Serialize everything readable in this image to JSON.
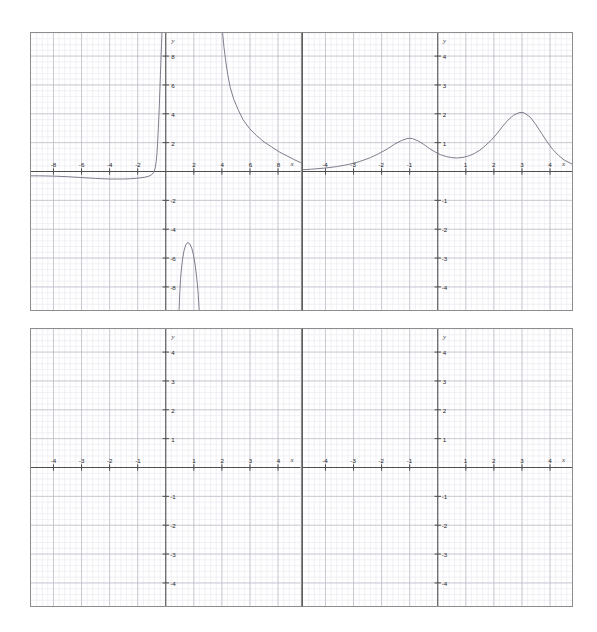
{
  "figure": {
    "width": 597,
    "height": 632,
    "background": "#ffffff",
    "panel_border_color": "#8d8d8d",
    "grid_minor_color": "#e3e3ec",
    "grid_major_color": "#b9b9c6",
    "axis_color": "#4d4d4d",
    "curve_color": "#6f6f80",
    "rows": 2,
    "cols": 2
  },
  "axis_names": {
    "x": "x",
    "y": "y"
  },
  "panels": [
    {
      "id": "panel-top-left",
      "xlabels": [
        "-8",
        "-6",
        "-4",
        "-2",
        "2",
        "4",
        "6",
        "8"
      ],
      "ylabels": [
        "8",
        "6",
        "4",
        "2",
        "-2",
        "-4",
        "-6",
        "-8"
      ],
      "xlim": [
        -9.6,
        9.6
      ],
      "ylim": [
        -9.6,
        9.6
      ],
      "has_curve": true
    },
    {
      "id": "panel-top-right",
      "xlabels": [
        "-4",
        "-3",
        "-2",
        "-1",
        "1",
        "2",
        "3",
        "4"
      ],
      "ylabels": [
        "4",
        "3",
        "2",
        "1",
        "-1",
        "-2",
        "-3",
        "-4"
      ],
      "xlim": [
        -4.8,
        4.8
      ],
      "ylim": [
        -4.8,
        4.8
      ],
      "has_curve": true
    },
    {
      "id": "panel-bottom-left",
      "xlabels": [
        "-4",
        "-3",
        "-2",
        "-1",
        "1",
        "2",
        "3",
        "4"
      ],
      "ylabels": [
        "4",
        "3",
        "2",
        "1",
        "-1",
        "-2",
        "-3",
        "-4"
      ],
      "xlim": [
        -4.8,
        4.8
      ],
      "ylim": [
        -4.8,
        4.8
      ],
      "has_curve": false
    },
    {
      "id": "panel-bottom-right",
      "xlabels": [
        "-4",
        "-3",
        "-2",
        "-1",
        "1",
        "2",
        "3",
        "4"
      ],
      "ylabels": [
        "4",
        "3",
        "2",
        "1",
        "-1",
        "-2",
        "-3",
        "-4"
      ],
      "xlim": [
        -4.8,
        4.8
      ],
      "ylim": [
        -4.8,
        4.8
      ],
      "has_curve": false
    }
  ],
  "chart_data": [
    {
      "type": "line",
      "title": "",
      "xlabel": "x",
      "ylabel": "y",
      "xlim": [
        -9.6,
        9.6
      ],
      "ylim": [
        -9.6,
        9.6
      ],
      "xticks": [
        -8,
        -6,
        -4,
        -2,
        2,
        4,
        6,
        8
      ],
      "yticks": [
        8,
        6,
        4,
        2,
        -2,
        -4,
        -6,
        -8
      ],
      "grid": true,
      "legend": "none",
      "panel": "top-left",
      "description": "Three disjoint branches: a flat slightly-negative left tail rising vertically near x=0, a descending right branch from x~4.5 decaying toward y~0.3, and an inverted narrow hump peaking near (1.5, -4.9).",
      "series": [
        {
          "name": "left-branch",
          "points": [
            [
              -9.6,
              -0.3
            ],
            [
              -9.0,
              -0.3
            ],
            [
              -8.0,
              -0.32
            ],
            [
              -7.0,
              -0.36
            ],
            [
              -6.0,
              -0.42
            ],
            [
              -5.0,
              -0.48
            ],
            [
              -4.0,
              -0.52
            ],
            [
              -3.0,
              -0.52
            ],
            [
              -2.5,
              -0.5
            ],
            [
              -2.0,
              -0.46
            ],
            [
              -1.5,
              -0.4
            ],
            [
              -1.2,
              -0.32
            ],
            [
              -1.0,
              -0.22
            ],
            [
              -0.85,
              -0.05
            ],
            [
              -0.75,
              0.25
            ],
            [
              -0.68,
              0.7
            ],
            [
              -0.62,
              1.3
            ],
            [
              -0.58,
              2.0
            ],
            [
              -0.54,
              2.8
            ],
            [
              -0.5,
              3.6
            ],
            [
              -0.46,
              4.5
            ],
            [
              -0.42,
              5.6
            ],
            [
              -0.38,
              6.7
            ],
            [
              -0.34,
              7.8
            ],
            [
              -0.3,
              8.8
            ],
            [
              -0.27,
              9.6
            ]
          ]
        },
        {
          "name": "right-branch",
          "points": [
            [
              4.05,
              9.6
            ],
            [
              4.15,
              8.6
            ],
            [
              4.28,
              7.6
            ],
            [
              4.42,
              6.7
            ],
            [
              4.6,
              5.8
            ],
            [
              4.85,
              5.0
            ],
            [
              5.15,
              4.3
            ],
            [
              5.5,
              3.6
            ],
            [
              5.95,
              3.0
            ],
            [
              6.45,
              2.5
            ],
            [
              7.0,
              2.05
            ],
            [
              7.55,
              1.7
            ],
            [
              8.1,
              1.35
            ],
            [
              8.7,
              1.05
            ],
            [
              9.2,
              0.8
            ],
            [
              9.6,
              0.62
            ]
          ]
        },
        {
          "name": "inverted-hump",
          "points": [
            [
              0.95,
              -9.6
            ],
            [
              1.0,
              -8.4
            ],
            [
              1.05,
              -7.5
            ],
            [
              1.12,
              -6.7
            ],
            [
              1.2,
              -6.05
            ],
            [
              1.3,
              -5.5
            ],
            [
              1.42,
              -5.1
            ],
            [
              1.55,
              -4.92
            ],
            [
              1.7,
              -5.0
            ],
            [
              1.85,
              -5.3
            ],
            [
              1.98,
              -5.8
            ],
            [
              2.1,
              -6.5
            ],
            [
              2.2,
              -7.3
            ],
            [
              2.3,
              -8.3
            ],
            [
              2.38,
              -9.6
            ]
          ]
        }
      ]
    },
    {
      "type": "line",
      "title": "",
      "xlabel": "x",
      "ylabel": "y",
      "xlim": [
        -4.8,
        4.8
      ],
      "ylim": [
        -4.8,
        4.8
      ],
      "xticks": [
        -4,
        -3,
        -2,
        -1,
        1,
        2,
        3,
        4
      ],
      "yticks": [
        4,
        3,
        2,
        1,
        -1,
        -2,
        -3,
        -4
      ],
      "grid": true,
      "legend": "none",
      "panel": "top-right",
      "description": "A positive, everywhere non-negative bimodal curve: a smaller peak of height about 1.15 at x=-1 and a taller peak of height about 2.05 at x=3, with a local dip near x=0.6 and tails decaying to zero.",
      "series": [
        {
          "name": "bimodal-curve",
          "points": [
            [
              -4.8,
              0.06
            ],
            [
              -4.5,
              0.08
            ],
            [
              -4.0,
              0.12
            ],
            [
              -3.6,
              0.17
            ],
            [
              -3.2,
              0.24
            ],
            [
              -2.8,
              0.34
            ],
            [
              -2.4,
              0.48
            ],
            [
              -2.1,
              0.62
            ],
            [
              -1.8,
              0.78
            ],
            [
              -1.55,
              0.94
            ],
            [
              -1.3,
              1.07
            ],
            [
              -1.1,
              1.14
            ],
            [
              -1.0,
              1.15
            ],
            [
              -0.9,
              1.14
            ],
            [
              -0.7,
              1.06
            ],
            [
              -0.5,
              0.94
            ],
            [
              -0.3,
              0.8
            ],
            [
              -0.1,
              0.68
            ],
            [
              0.1,
              0.58
            ],
            [
              0.3,
              0.52
            ],
            [
              0.5,
              0.48
            ],
            [
              0.7,
              0.47
            ],
            [
              0.9,
              0.49
            ],
            [
              1.1,
              0.54
            ],
            [
              1.3,
              0.62
            ],
            [
              1.5,
              0.74
            ],
            [
              1.7,
              0.9
            ],
            [
              1.9,
              1.08
            ],
            [
              2.1,
              1.3
            ],
            [
              2.3,
              1.55
            ],
            [
              2.5,
              1.78
            ],
            [
              2.7,
              1.95
            ],
            [
              2.9,
              2.04
            ],
            [
              3.0,
              2.05
            ],
            [
              3.1,
              2.02
            ],
            [
              3.3,
              1.88
            ],
            [
              3.5,
              1.62
            ],
            [
              3.7,
              1.32
            ],
            [
              3.9,
              1.02
            ],
            [
              4.1,
              0.76
            ],
            [
              4.3,
              0.56
            ],
            [
              4.5,
              0.4
            ],
            [
              4.8,
              0.25
            ]
          ]
        }
      ]
    },
    {
      "type": "line",
      "title": "",
      "xlabel": "x",
      "ylabel": "y",
      "xlim": [
        -4.8,
        4.8
      ],
      "ylim": [
        -4.8,
        4.8
      ],
      "xticks": [
        -4,
        -3,
        -2,
        -1,
        1,
        2,
        3,
        4
      ],
      "yticks": [
        4,
        3,
        2,
        1,
        -1,
        -2,
        -3,
        -4
      ],
      "grid": true,
      "legend": "none",
      "panel": "bottom-left",
      "description": "Empty coordinate grid with no plotted data.",
      "series": []
    },
    {
      "type": "line",
      "title": "",
      "xlabel": "x",
      "ylabel": "y",
      "xlim": [
        -4.8,
        4.8
      ],
      "ylim": [
        -4.8,
        4.8
      ],
      "xticks": [
        -4,
        -3,
        -2,
        -1,
        1,
        2,
        3,
        4
      ],
      "yticks": [
        4,
        3,
        2,
        1,
        -1,
        -2,
        -3,
        -4
      ],
      "grid": true,
      "legend": "none",
      "panel": "bottom-right",
      "description": "Empty coordinate grid with no plotted data.",
      "series": []
    }
  ]
}
